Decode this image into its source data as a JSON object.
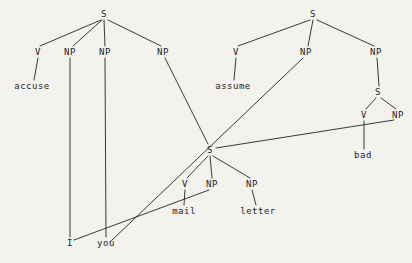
{
  "figure": {
    "type": "syntax-tree-diagram",
    "background_color": "#f3f2ef",
    "ink_color": "#242424",
    "width": 412,
    "height": 263
  },
  "nodes": {
    "s_left": {
      "label": "S",
      "x": 104,
      "y": 14
    },
    "v_left": {
      "label": "V",
      "x": 38,
      "y": 52
    },
    "np_left_1": {
      "label": "NP",
      "x": 70,
      "y": 52
    },
    "np_left_2": {
      "label": "NP",
      "x": 105,
      "y": 52
    },
    "np_left_3": {
      "label": "NP",
      "x": 163,
      "y": 52
    },
    "w_accuse": {
      "label": "accuse",
      "x": 32,
      "y": 86
    },
    "s_right": {
      "label": "S",
      "x": 313,
      "y": 14
    },
    "v_right": {
      "label": "V",
      "x": 236,
      "y": 52
    },
    "np_right_1": {
      "label": "NP",
      "x": 306,
      "y": 52
    },
    "np_right_2": {
      "label": "NP",
      "x": 376,
      "y": 52
    },
    "w_assume": {
      "label": "assume",
      "x": 233,
      "y": 86
    },
    "s_inner": {
      "label": "S",
      "x": 378,
      "y": 92
    },
    "v_inner": {
      "label": "V",
      "x": 364,
      "y": 115
    },
    "np_inner": {
      "label": "NP",
      "x": 398,
      "y": 115
    },
    "w_bad": {
      "label": "bad",
      "x": 363,
      "y": 155
    },
    "s_center": {
      "label": "S",
      "x": 210,
      "y": 150
    },
    "v_center": {
      "label": "V",
      "x": 185,
      "y": 184
    },
    "np_center_1": {
      "label": "NP",
      "x": 212,
      "y": 184
    },
    "np_center_2": {
      "label": "NP",
      "x": 252,
      "y": 184
    },
    "w_mail": {
      "label": "mail",
      "x": 184,
      "y": 211
    },
    "w_letter": {
      "label": "letter",
      "x": 258,
      "y": 211
    },
    "w_i": {
      "label": "I",
      "x": 70,
      "y": 243
    },
    "w_you": {
      "label": "you",
      "x": 106,
      "y": 243
    }
  },
  "edges": [
    {
      "name": "s_left-v_left",
      "x1": 101,
      "y1": 20,
      "x2": 40,
      "y2": 46
    },
    {
      "name": "s_left-np_left_1",
      "x1": 102,
      "y1": 20,
      "x2": 73,
      "y2": 46
    },
    {
      "name": "s_left-np_left_2",
      "x1": 104,
      "y1": 20,
      "x2": 105,
      "y2": 46
    },
    {
      "name": "s_left-np_left_3",
      "x1": 108,
      "y1": 20,
      "x2": 161,
      "y2": 46
    },
    {
      "name": "v_left-accuse",
      "x1": 38,
      "y1": 58,
      "x2": 34,
      "y2": 80
    },
    {
      "name": "np_left_1-i",
      "x1": 70,
      "y1": 58,
      "x2": 70,
      "y2": 237
    },
    {
      "name": "np_left_2-you",
      "x1": 105,
      "y1": 58,
      "x2": 106,
      "y2": 237
    },
    {
      "name": "np_left_3-s_center",
      "x1": 165,
      "y1": 58,
      "x2": 208,
      "y2": 144
    },
    {
      "name": "s_right-v_right",
      "x1": 310,
      "y1": 20,
      "x2": 238,
      "y2": 46
    },
    {
      "name": "s_right-np_right_1",
      "x1": 313,
      "y1": 20,
      "x2": 308,
      "y2": 46
    },
    {
      "name": "s_right-np_right_2",
      "x1": 317,
      "y1": 20,
      "x2": 374,
      "y2": 46
    },
    {
      "name": "v_right-assume",
      "x1": 236,
      "y1": 58,
      "x2": 234,
      "y2": 80
    },
    {
      "name": "np_right_1-you",
      "x1": 303,
      "y1": 58,
      "x2": 110,
      "y2": 242
    },
    {
      "name": "np_right_2-s_inner",
      "x1": 377,
      "y1": 58,
      "x2": 379,
      "y2": 86
    },
    {
      "name": "s_inner-v_inner",
      "x1": 376,
      "y1": 98,
      "x2": 366,
      "y2": 109
    },
    {
      "name": "s_inner-np_inner",
      "x1": 381,
      "y1": 98,
      "x2": 396,
      "y2": 109
    },
    {
      "name": "v_inner-bad",
      "x1": 364,
      "y1": 121,
      "x2": 364,
      "y2": 149
    },
    {
      "name": "np_inner-s_center",
      "x1": 394,
      "y1": 120,
      "x2": 216,
      "y2": 148
    },
    {
      "name": "s_center-v_center",
      "x1": 208,
      "y1": 156,
      "x2": 187,
      "y2": 178
    },
    {
      "name": "s_center-np_center_1",
      "x1": 210,
      "y1": 156,
      "x2": 212,
      "y2": 178
    },
    {
      "name": "s_center-np_center_2",
      "x1": 213,
      "y1": 156,
      "x2": 250,
      "y2": 178
    },
    {
      "name": "v_center-mail",
      "x1": 185,
      "y1": 190,
      "x2": 184,
      "y2": 205
    },
    {
      "name": "np_center_1-i",
      "x1": 209,
      "y1": 190,
      "x2": 74,
      "y2": 240
    },
    {
      "name": "np_center_2-letter",
      "x1": 252,
      "y1": 190,
      "x2": 256,
      "y2": 205
    }
  ],
  "words": [
    "accuse",
    "assume",
    "bad",
    "mail",
    "letter",
    "I",
    "you"
  ]
}
